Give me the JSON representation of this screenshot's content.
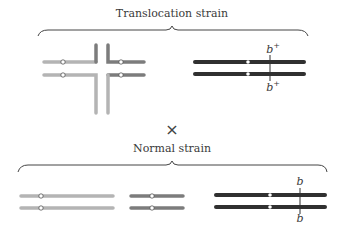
{
  "top_group": {
    "title": "Translocation strain",
    "gene_label_top": "b",
    "gene_label_bottom": "b",
    "allele_superscript": "+"
  },
  "cross_symbol": "×",
  "bottom_group": {
    "title": "Normal strain",
    "gene_label_top": "b",
    "gene_label_bottom": "b"
  },
  "colors": {
    "light_chromosome": "#b4b4b4",
    "medium_chromosome": "#7c7c7c",
    "dark_chromosome": "#303030",
    "brace": "#444444"
  }
}
